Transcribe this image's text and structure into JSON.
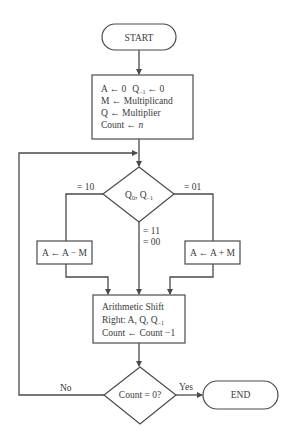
{
  "diagram": {
    "type": "flowchart",
    "colors": {
      "line": "#4a4a4a",
      "text": "#3a3a3a",
      "background": "#ffffff"
    },
    "start": {
      "label": "START"
    },
    "init": {
      "line1_a": "A ← 0",
      "line1_q": "Q",
      "line1_q_sub": "−1",
      "line1_q_val": "← 0",
      "line2": "M ← Multiplicand",
      "line3": "Q ← Multiplier",
      "line4_prefix": "Count ← ",
      "line4_var": "n"
    },
    "decision1": {
      "q0": "Q",
      "q0_sub": "0",
      "sep": ", Q",
      "qm1_sub": "−1",
      "branch_left": "= 10",
      "branch_right": "= 01",
      "branch_down_1": "= 11",
      "branch_down_2": "= 00"
    },
    "subtract": {
      "label": "A ← A − M"
    },
    "add": {
      "label": "A ← A + M"
    },
    "shift": {
      "line1": "Arithmetic Shift",
      "line2_prefix": "Right:  A, Q, Q",
      "line2_sub": "−1",
      "line3": "Count ← Count −1"
    },
    "decision2": {
      "label": "Count = 0?",
      "no_label": "No",
      "yes_label": "Yes"
    },
    "end": {
      "label": "END"
    }
  }
}
